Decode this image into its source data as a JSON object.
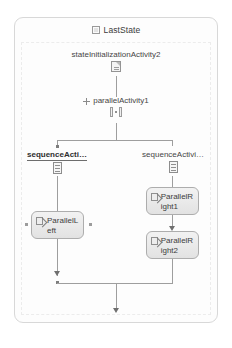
{
  "canvas": {
    "width": 232,
    "height": 348,
    "background": "#ffffff"
  },
  "state": {
    "title": "LastState",
    "title_icon": "state-square-icon",
    "border_color": "#d8d8d8"
  },
  "nodes": {
    "state_initialization": {
      "label": "stateInitializationActivity2",
      "icon": "state-initialization-activity-icon"
    },
    "parallel_activity": {
      "label": "parallelActivity1",
      "icon": "parallel-activity-icon",
      "expander": "expand-plus-icon"
    },
    "sequence_left": {
      "label": "sequenceActi…",
      "icon": "sequence-activity-icon",
      "selected": true
    },
    "sequence_right": {
      "label": "sequenceActivi…",
      "icon": "sequence-activity-icon",
      "selected": false
    },
    "parallel_left": {
      "label": "ParallelLeft",
      "icon": "code-activity-icon"
    },
    "parallel_right_1": {
      "label": "ParallelRight1",
      "icon": "code-activity-icon"
    },
    "parallel_right_2": {
      "label": "ParallelRight2",
      "icon": "code-activity-icon"
    }
  },
  "colors": {
    "connector": "#9e9e9e",
    "arrow": "#6f6f6f",
    "leaf_border": "#adadad",
    "text": "#454545"
  }
}
